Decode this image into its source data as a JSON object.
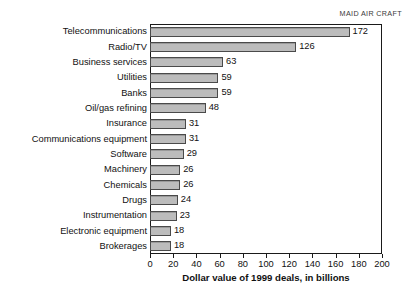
{
  "figure": {
    "source_label": "MAID AIR CRAFT",
    "caption_fragment": ""
  },
  "chart_data": {
    "type": "bar",
    "orientation": "horizontal",
    "title": "",
    "subtitle": "",
    "xlabel": "Dollar value of 1999 deals, in billions",
    "ylabel": "",
    "xlim": [
      0,
      200
    ],
    "xticks": [
      0,
      20,
      40,
      60,
      80,
      100,
      120,
      140,
      160,
      180,
      200
    ],
    "xtick_labels": [
      "0",
      "20",
      "40",
      "60",
      "80",
      "100",
      "120",
      "140",
      "160",
      "180",
      "200"
    ],
    "grid": false,
    "legend": false,
    "legend_position": "none",
    "bar_fill_color": "#b3b3b3",
    "bar_edge_color": "#4a4a4a",
    "show_value_labels": true,
    "categories": [
      "Telecommunications",
      "Radio/TV",
      "Business services",
      "Utilities",
      "Banks",
      "Oil/gas refining",
      "Insurance",
      "Communications equipment",
      "Software",
      "Machinery",
      "Chemicals",
      "Drugs",
      "Instrumentation",
      "Electronic equipment",
      "Brokerages"
    ],
    "values": [
      172,
      126,
      63,
      59,
      59,
      48,
      31,
      31,
      29,
      26,
      26,
      24,
      23,
      18,
      18
    ],
    "value_labels": [
      "172",
      "126",
      "63",
      "59",
      "59",
      "48",
      "31",
      "31",
      "29",
      "26",
      "26",
      "24",
      "23",
      "18",
      "18"
    ]
  }
}
